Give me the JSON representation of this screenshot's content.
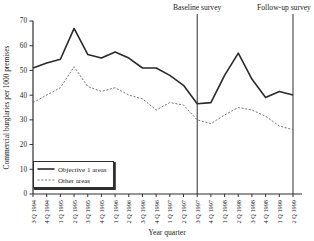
{
  "figure": {
    "background": "#ffffff"
  },
  "chart_data": {
    "type": "line",
    "title": "",
    "xlabel": "Year quarter",
    "ylabel": "Commercial burglaries per 1000 premises",
    "ylim": [
      0,
      70
    ],
    "yticks": [
      0,
      10,
      20,
      30,
      40,
      50,
      60,
      70
    ],
    "grid": false,
    "categories": [
      "3 Q 1994",
      "4 Q 1994",
      "1 Q 1995",
      "2 Q 1995",
      "3 Q 1995",
      "4 Q 1995",
      "1 Q 1996",
      "2 Q 1996",
      "3 Q 1996",
      "4 Q 1996",
      "1 Q 1997",
      "2 Q 1997",
      "3 Q 1997",
      "4 Q 1997",
      "1 Q 1998",
      "2 Q 1998",
      "3 Q 1998",
      "4 Q 1998",
      "1 Q 1999",
      "2 Q 1999"
    ],
    "series": [
      {
        "name": "Objective 1 areas",
        "line_style": "solid",
        "color": "#2a2a2a",
        "values": [
          51,
          53,
          54.5,
          67,
          56.5,
          55,
          57.5,
          55,
          51,
          51,
          48,
          44,
          36.5,
          37,
          48,
          57,
          46.5,
          39,
          41.5,
          40
        ]
      },
      {
        "name": "Other areas",
        "line_style": "dotted",
        "color": "#5f5f5f",
        "values": [
          37,
          40,
          43,
          51.5,
          43.5,
          41.5,
          43,
          40,
          38.5,
          34,
          37,
          36,
          30,
          28.5,
          32,
          35,
          34,
          31.5,
          27.5,
          26
        ]
      }
    ],
    "annotations": [
      {
        "label": "Baseline survey",
        "category": "3 Q 1997"
      },
      {
        "label": "Follow-up survey",
        "category": "2 Q 1999"
      }
    ],
    "legend": {
      "position": "lower-left",
      "border": true
    },
    "axis_color": "#2f2f2f",
    "text_color": "#1c1c1c"
  }
}
